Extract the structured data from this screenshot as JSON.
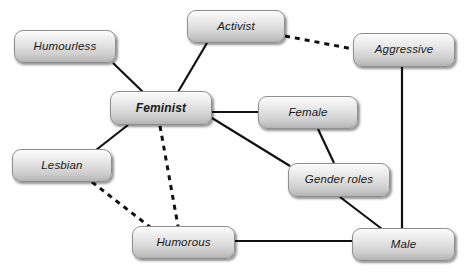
{
  "diagram": {
    "type": "concept-map",
    "background_color": "#ffffff",
    "node_fill_top": "#fbfbfb",
    "node_fill_bottom": "#b3b3b3",
    "node_border_color": "#8e8e8e",
    "edge_color": "#111111",
    "nodes": [
      {
        "id": "humourless",
        "label": "Humourless",
        "x": 14,
        "y": 30,
        "w": 102,
        "h": 33,
        "emphasis": "normal"
      },
      {
        "id": "activist",
        "label": "Activist",
        "x": 187,
        "y": 10,
        "w": 98,
        "h": 33,
        "emphasis": "normal"
      },
      {
        "id": "aggressive",
        "label": "Aggressive",
        "x": 353,
        "y": 33,
        "w": 102,
        "h": 34,
        "emphasis": "normal"
      },
      {
        "id": "feminist",
        "label": "Feminist",
        "x": 110,
        "y": 91,
        "w": 102,
        "h": 34,
        "emphasis": "bold"
      },
      {
        "id": "female",
        "label": "Female",
        "x": 258,
        "y": 96,
        "w": 100,
        "h": 33,
        "emphasis": "normal"
      },
      {
        "id": "lesbian",
        "label": "Lesbian",
        "x": 12,
        "y": 149,
        "w": 100,
        "h": 33,
        "emphasis": "normal"
      },
      {
        "id": "gender-roles",
        "label": "Gender roles",
        "x": 288,
        "y": 163,
        "w": 102,
        "h": 34,
        "emphasis": "normal"
      },
      {
        "id": "humorous",
        "label": "Humorous",
        "x": 132,
        "y": 226,
        "w": 103,
        "h": 33,
        "emphasis": "normal"
      },
      {
        "id": "male",
        "label": "Male",
        "x": 352,
        "y": 228,
        "w": 103,
        "h": 33,
        "emphasis": "normal"
      }
    ],
    "edges": [
      {
        "id": "humourless-feminist",
        "from": "humourless",
        "to": "feminist",
        "style": "solid",
        "x1": 113,
        "y1": 63,
        "x2": 143,
        "y2": 92
      },
      {
        "id": "activist-feminist",
        "from": "activist",
        "to": "feminist",
        "style": "solid",
        "x1": 207,
        "y1": 43,
        "x2": 178,
        "y2": 92
      },
      {
        "id": "activist-aggressive",
        "from": "activist",
        "to": "aggressive",
        "style": "dashed",
        "x1": 285,
        "y1": 36,
        "x2": 353,
        "y2": 49
      },
      {
        "id": "feminist-female",
        "from": "feminist",
        "to": "female",
        "style": "solid",
        "x1": 212,
        "y1": 112,
        "x2": 258,
        "y2": 112
      },
      {
        "id": "feminist-gender-roles",
        "from": "feminist",
        "to": "gender-roles",
        "style": "solid",
        "x1": 212,
        "y1": 118,
        "x2": 290,
        "y2": 166
      },
      {
        "id": "feminist-lesbian",
        "from": "feminist",
        "to": "lesbian",
        "style": "solid",
        "x1": 128,
        "y1": 125,
        "x2": 96,
        "y2": 150
      },
      {
        "id": "feminist-humorous",
        "from": "feminist",
        "to": "humorous",
        "style": "dashed",
        "x1": 160,
        "y1": 126,
        "x2": 178,
        "y2": 226
      },
      {
        "id": "lesbian-humorous",
        "from": "lesbian",
        "to": "humorous",
        "style": "dashed",
        "x1": 92,
        "y1": 182,
        "x2": 150,
        "y2": 227
      },
      {
        "id": "female-gender-roles",
        "from": "female",
        "to": "gender-roles",
        "style": "solid",
        "x1": 318,
        "y1": 129,
        "x2": 334,
        "y2": 163
      },
      {
        "id": "gender-roles-male",
        "from": "gender-roles",
        "to": "male",
        "style": "solid",
        "x1": 340,
        "y1": 197,
        "x2": 382,
        "y2": 229
      },
      {
        "id": "aggressive-male",
        "from": "aggressive",
        "to": "male",
        "style": "solid",
        "x1": 402,
        "y1": 67,
        "x2": 402,
        "y2": 229
      },
      {
        "id": "humorous-male",
        "from": "humorous",
        "to": "male",
        "style": "solid",
        "x1": 235,
        "y1": 241,
        "x2": 352,
        "y2": 241
      }
    ]
  }
}
